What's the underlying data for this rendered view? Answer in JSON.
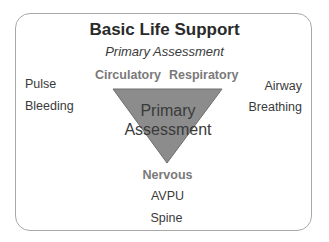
{
  "title": "Basic Life Support",
  "subtitle": "Primary Assessment",
  "triangle": {
    "line1": "Primary",
    "line2": "Assessment",
    "fill": "#8c8c8c",
    "stroke": "#6e6e6e"
  },
  "categories": {
    "top_left": "Circulatory",
    "top_right": "Respiratory",
    "bottom": "Nervous"
  },
  "left_items": [
    "Pulse",
    "Bleeding"
  ],
  "right_items": [
    "Airway",
    "Breathing"
  ],
  "bottom_items": [
    "AVPU",
    "Spine"
  ]
}
